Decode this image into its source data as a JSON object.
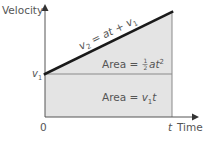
{
  "diagram": {
    "y_axis_label": "Velocity",
    "x_axis_label": "Time",
    "x_end_label": "t",
    "origin_label": "0",
    "v1_label": {
      "base": "v",
      "sub": "1"
    },
    "line_equation": {
      "lhs_base": "v",
      "lhs_sub": "2",
      "eq": " = ",
      "rhs": "at + ",
      "rhs_base": "v",
      "rhs_sub": "1"
    },
    "triangle_area": {
      "prefix": "Area = ",
      "num": "1",
      "den": "2",
      "expr": "at",
      "sup": "2"
    },
    "rect_area": {
      "prefix": "Area = ",
      "base": "v",
      "sub": "1",
      "suffix": "t"
    },
    "colors": {
      "fill": "#e4e4e4",
      "line": "#1a1a1a",
      "axis": "#555555",
      "edge": "#8a8a8a",
      "text": "#555555"
    }
  }
}
